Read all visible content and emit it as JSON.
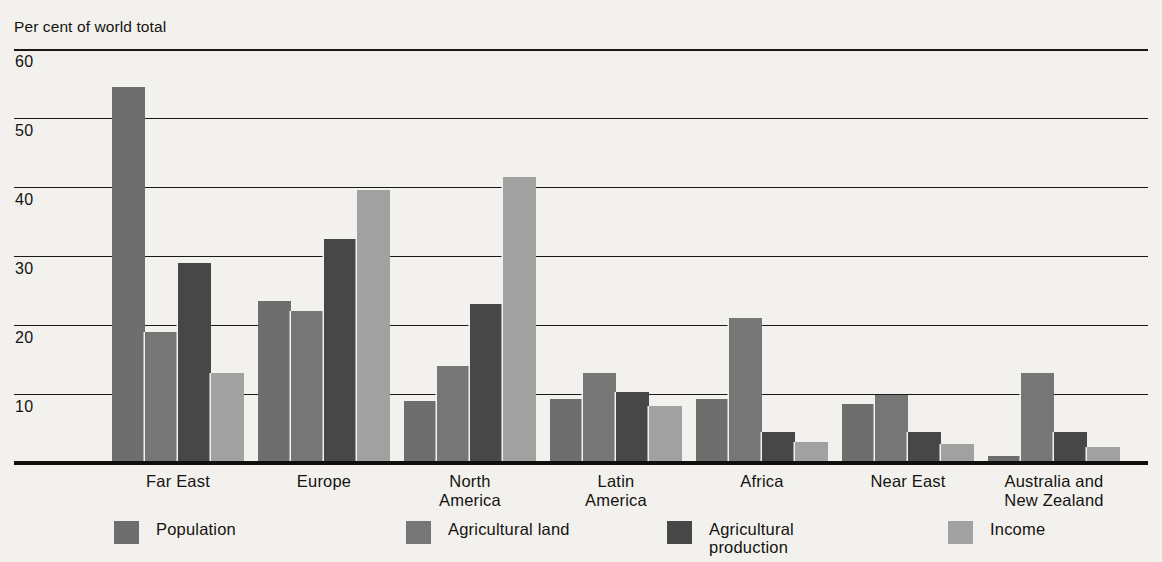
{
  "chart_data": {
    "type": "bar",
    "title": "Per cent of world total",
    "xlabel": "",
    "ylabel": "Per cent of world total",
    "ylim": [
      0,
      60
    ],
    "yticks": [
      10,
      20,
      30,
      40,
      50,
      60
    ],
    "ytick_labels": [
      "10",
      "20",
      "30",
      "40",
      "50",
      "60"
    ],
    "grid": true,
    "legend_position": "bottom",
    "categories": [
      "Far East",
      "Europe",
      "North\nAmerica",
      "Latin\nAmerica",
      "Africa",
      "Near East",
      "Australia and\nNew Zealand"
    ],
    "series": [
      {
        "name": "Population",
        "color": "#6e6e6e",
        "values": [
          54.5,
          23.5,
          9.0,
          9.3,
          9.3,
          8.5,
          1.0
        ]
      },
      {
        "name": "Agricultural land",
        "color": "#767676",
        "values": [
          19.0,
          22.0,
          14.0,
          13.0,
          21.0,
          9.8,
          13.0
        ]
      },
      {
        "name": "Agricultural\nproduction",
        "color": "#474747",
        "values": [
          29.0,
          32.5,
          23.0,
          10.3,
          4.5,
          4.5,
          4.5
        ]
      },
      {
        "name": "Income",
        "color": "#a1a1a1",
        "values": [
          13.0,
          39.5,
          41.5,
          8.3,
          3.0,
          2.7,
          2.3
        ]
      }
    ]
  },
  "legend": {
    "items": [
      {
        "label": "Population",
        "swatch": "population-swatch"
      },
      {
        "label": "Agricultural land",
        "swatch": "agricultural-land-swatch"
      },
      {
        "label": "Agricultural\nproduction",
        "swatch": "agricultural-production-swatch"
      },
      {
        "label": "Income",
        "swatch": "income-swatch"
      }
    ]
  },
  "colors": {
    "background": "#f2f1ee",
    "axis": "#100f0d",
    "grid": "#1b1916",
    "population": "#6e6e6e",
    "agricultural_land": "#767676",
    "agricultural_production": "#474747",
    "income": "#a1a1a1"
  }
}
